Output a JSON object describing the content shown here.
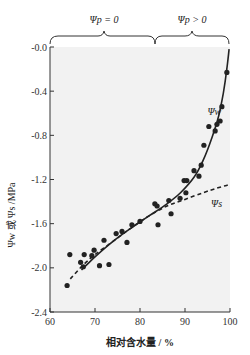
{
  "chart_data": {
    "type": "scatter",
    "title": "",
    "xlabel": "相对含水量 / %",
    "ylabel": "Ψw 或 Ψs /MPa",
    "xlim": [
      60,
      100
    ],
    "ylim": [
      -2.4,
      0.0
    ],
    "x_ticks": [
      60,
      70,
      80,
      90,
      100
    ],
    "x_tick_labels": [
      "60",
      "70",
      "80",
      "90",
      "100"
    ],
    "y_ticks": [
      0.0,
      -0.4,
      -0.8,
      -1.2,
      -1.6,
      -2.0,
      -2.4
    ],
    "y_tick_labels": [
      "-0.0",
      "-0.4",
      "-0.8",
      "-1.2",
      "-1.6",
      "-2.0",
      "-2.4"
    ],
    "grid": false,
    "regions": [
      {
        "label": "Ψp = 0",
        "x_range": [
          60,
          83
        ]
      },
      {
        "label": "Ψp > 0",
        "x_range": [
          83,
          100
        ]
      }
    ],
    "series": [
      {
        "name": "Ψw (measured points)",
        "style": "markers",
        "color": "#222222",
        "points": [
          [
            63.8,
            -2.16
          ],
          [
            64.4,
            -1.88
          ],
          [
            66.8,
            -1.95
          ],
          [
            67.4,
            -1.99
          ],
          [
            67.6,
            -1.88
          ],
          [
            69.3,
            -1.89
          ],
          [
            69.8,
            -1.84
          ],
          [
            71.0,
            -1.98
          ],
          [
            72.0,
            -1.75
          ],
          [
            73.1,
            -1.97
          ],
          [
            74.7,
            -1.69
          ],
          [
            76.0,
            -1.67
          ],
          [
            77.1,
            -1.77
          ],
          [
            78.2,
            -1.61
          ],
          [
            80.0,
            -1.58
          ],
          [
            83.3,
            -1.42
          ],
          [
            83.8,
            -1.44
          ],
          [
            84.0,
            -1.61
          ],
          [
            86.4,
            -1.39
          ],
          [
            86.9,
            -1.51
          ],
          [
            88.9,
            -1.37
          ],
          [
            89.8,
            -1.21
          ],
          [
            90.4,
            -1.21
          ],
          [
            90.2,
            -1.32
          ],
          [
            92.0,
            -1.12
          ],
          [
            93.1,
            -1.17
          ],
          [
            93.6,
            -1.07
          ],
          [
            94.2,
            -0.89
          ],
          [
            95.3,
            -0.72
          ],
          [
            96.7,
            -0.76
          ],
          [
            97.1,
            -0.7
          ],
          [
            97.8,
            -0.67
          ],
          [
            98.2,
            -0.54
          ],
          [
            99.3,
            -0.23
          ]
        ]
      },
      {
        "name": "Ψw",
        "style": "solid-line",
        "color": "#222222",
        "points": [
          [
            67,
            -2.02
          ],
          [
            70,
            -1.9
          ],
          [
            74,
            -1.76
          ],
          [
            78,
            -1.64
          ],
          [
            82,
            -1.53
          ],
          [
            86,
            -1.42
          ],
          [
            89,
            -1.32
          ],
          [
            92,
            -1.18
          ],
          [
            94,
            -1.03
          ],
          [
            96,
            -0.82
          ],
          [
            97.5,
            -0.62
          ],
          [
            98.5,
            -0.42
          ],
          [
            99.3,
            -0.2
          ],
          [
            99.8,
            -0.02
          ]
        ]
      },
      {
        "name": "Ψs",
        "style": "dashed-line",
        "color": "#222222",
        "points": [
          [
            64.5,
            -2.1
          ],
          [
            67,
            -1.99
          ],
          [
            70,
            -1.88
          ],
          [
            74,
            -1.76
          ],
          [
            78,
            -1.64
          ],
          [
            82,
            -1.53
          ],
          [
            86,
            -1.44
          ],
          [
            90,
            -1.38
          ],
          [
            94,
            -1.32
          ],
          [
            97,
            -1.28
          ],
          [
            99.5,
            -1.25
          ]
        ]
      }
    ],
    "annotations": [
      {
        "text": "Ψw",
        "x": 95.0,
        "y": -0.62
      },
      {
        "text": "Ψs",
        "x": 95.8,
        "y": -1.45
      }
    ]
  }
}
